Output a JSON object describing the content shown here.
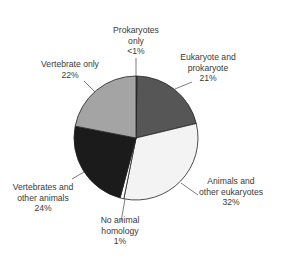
{
  "chart_data": {
    "type": "pie",
    "title": "",
    "start_angle": "top, clockwise",
    "slices": [
      {
        "label": "Prokaryotes only",
        "value_label": "<1%",
        "value": 0.3,
        "color": "#666666"
      },
      {
        "label": "Eukaryote and prokaryote",
        "value_label": "21%",
        "value": 21,
        "color": "#565656"
      },
      {
        "label": "Animals and other eukaryotes",
        "value_label": "32%",
        "value": 32,
        "color": "#f3f3f3"
      },
      {
        "label": "No animal homology",
        "value_label": "1%",
        "value": 1,
        "color": "#ffffff"
      },
      {
        "label": "Vertebrates and other animals",
        "value_label": "24%",
        "value": 24,
        "color": "#1b1b1b"
      },
      {
        "label": "Vertebrate only",
        "value_label": "22%",
        "value": 22,
        "color": "#a4a4a4"
      }
    ]
  },
  "labels": {
    "prok": {
      "l1": "Prokaryotes",
      "l2": "only",
      "pct": "<1%"
    },
    "euk": {
      "l1": "Eukaryote and",
      "l2": "prokaryote",
      "pct": "21%"
    },
    "anim": {
      "l1": "Animals and",
      "l2": "other eukaryotes",
      "pct": "32%"
    },
    "noan": {
      "l1": "No animal",
      "l2": "homology",
      "pct": "1%"
    },
    "vert_other": {
      "l1": "Vertebrates and",
      "l2": "other animals",
      "pct": "24%"
    },
    "vert_only": {
      "l1": "Vertebrate only",
      "pct": "22%"
    }
  }
}
